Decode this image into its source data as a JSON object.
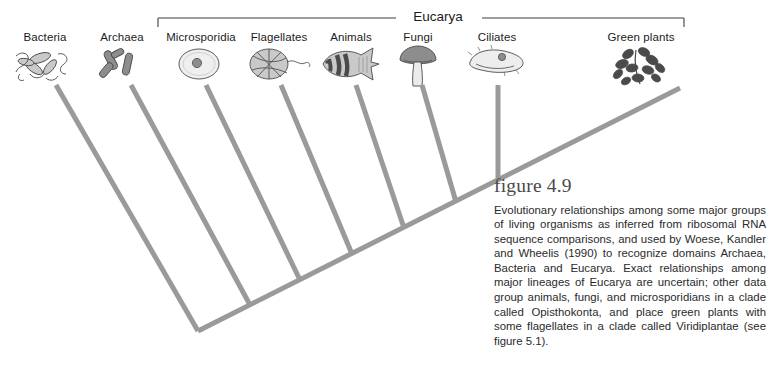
{
  "figure": {
    "number_label": "figure 4.9",
    "caption": "Evolutionary relationships among some major groups of living organisms as inferred from ribosomal RNA sequence comparisons, and used by Woese, Kandler and Wheelis (1990) to recognize domains Archaea, Bacteria and Eucarya. Exact relationships among major lineages of Eucarya are uncertain; other data group animals, fungi, and microsporidians in a clade called Opisthokonta, and place green plants with some flagellates in a clade called Viridiplantae (see figure 5.1)."
  },
  "clade_bracket": {
    "label": "Eucarya",
    "label_x": 438,
    "label_y": 9,
    "bracket_left_x": 158,
    "bracket_right_x": 684,
    "bracket_y": 18,
    "tick_height": 9,
    "gap_left": 396,
    "gap_right": 482
  },
  "colors": {
    "branch": "#9a9a9a",
    "bracket": "#3f3f3f",
    "label_text": "#1b1b1b",
    "caption_text": "#2a2a2a",
    "figure_number": "#4a4a4a",
    "background": "#ffffff",
    "icon_dark": "#4a4a4a",
    "icon_mid": "#8d8d8d",
    "icon_light": "#c9c9c9"
  },
  "tree": {
    "backbone": {
      "x1": 198,
      "y1": 331,
      "x2": 680,
      "y2": 88
    },
    "branch_width": 5,
    "taxa": [
      {
        "name": "Bacteria",
        "label_x": 45,
        "label_y": 31,
        "icon_x": 45,
        "icon_y": 44,
        "icon": "bacteria-icon",
        "tip_x": 56,
        "tip_y": 85,
        "node_x": 198,
        "node_y": 331
      },
      {
        "name": "Archaea",
        "label_x": 122,
        "label_y": 31,
        "icon_x": 122,
        "icon_y": 44,
        "icon": "archaea-icon",
        "tip_x": 131,
        "tip_y": 85,
        "node_x": 250,
        "node_y": 305
      },
      {
        "name": "Microsporidia",
        "label_x": 201,
        "label_y": 31,
        "icon_x": 199,
        "icon_y": 44,
        "icon": "microsporidia-icon",
        "tip_x": 206,
        "tip_y": 85,
        "node_x": 300,
        "node_y": 280
      },
      {
        "name": "Flagellates",
        "label_x": 279,
        "label_y": 31,
        "icon_x": 278,
        "icon_y": 44,
        "icon": "flagellates-icon",
        "tip_x": 281,
        "tip_y": 85,
        "node_x": 352,
        "node_y": 254
      },
      {
        "name": "Animals",
        "label_x": 351,
        "label_y": 31,
        "icon_x": 351,
        "icon_y": 44,
        "icon": "animals-icon",
        "tip_x": 356,
        "tip_y": 85,
        "node_x": 404,
        "node_y": 228
      },
      {
        "name": "Fungi",
        "label_x": 418,
        "label_y": 31,
        "icon_x": 418,
        "icon_y": 44,
        "icon": "fungi-icon",
        "tip_x": 422,
        "tip_y": 85,
        "node_x": 456,
        "node_y": 202
      },
      {
        "name": "Ciliates",
        "label_x": 497,
        "label_y": 31,
        "icon_x": 497,
        "icon_y": 44,
        "icon": "ciliates-icon",
        "tip_x": 498,
        "tip_y": 85,
        "node_x": 498,
        "node_y": 181
      },
      {
        "name": "Green plants",
        "label_x": 641,
        "label_y": 31,
        "icon_x": 641,
        "icon_y": 44,
        "icon": "green-plants-icon",
        "tip_x": 680,
        "tip_y": 88,
        "node_x": 498,
        "node_y": 181
      }
    ]
  }
}
